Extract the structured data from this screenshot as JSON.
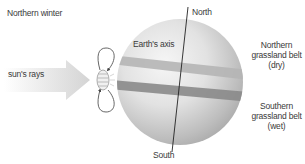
{
  "title": "Northern winter",
  "labels": {
    "sun_rays": "sun's rays",
    "earth_axis": "Earth's axis",
    "north": "North",
    "south": "South",
    "northern_belt": {
      "line1": "Northern",
      "line2": "grassland belt",
      "line3": "(dry)"
    },
    "southern_belt": {
      "line1": "Southern",
      "line2": "grassland belt",
      "line3": "(wet)"
    }
  },
  "colors": {
    "globe_light": "#f4f4f4",
    "globe_dark": "#a8a8a8",
    "band_upper": "#b8b8b8",
    "band_lower": "#8a8a8a",
    "axis_line": "#222222",
    "arrow_light": "#fbfbfb",
    "arrow_dark": "#d6d6d6",
    "text": "#3a3a3a"
  }
}
